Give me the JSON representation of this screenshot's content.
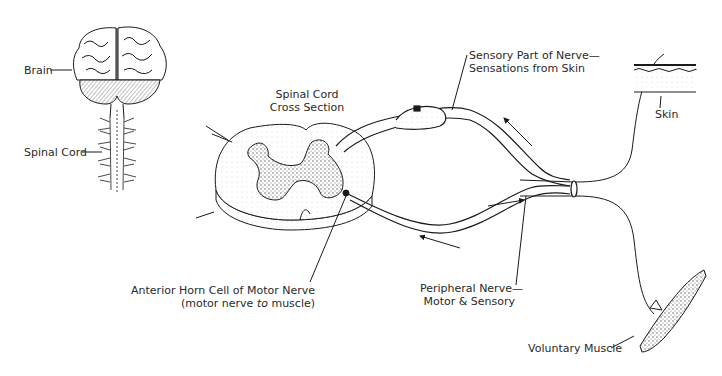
{
  "diagram": {
    "labels": {
      "brain": "Brain",
      "spinal_cord": "Spinal Cord",
      "cross_section_line1": "Spinal Cord",
      "cross_section_line2": "Cross Section",
      "sensory_line1": "Sensory Part of Nerve—",
      "sensory_line2": "Sensations from Skin",
      "skin": "Skin",
      "anterior_line1": "Anterior Horn Cell of Motor Nerve",
      "anterior_line2_a": "(motor nerve ",
      "anterior_line2_em": "to",
      "anterior_line2_b": " muscle)",
      "peripheral_line1": "Peripheral Nerve—",
      "peripheral_line2": "Motor & Sensory",
      "muscle": "Voluntary Muscle"
    },
    "colors": {
      "ink": "#1a1a1a",
      "gray_matter": "#8a8a8a",
      "background": "#ffffff"
    }
  }
}
